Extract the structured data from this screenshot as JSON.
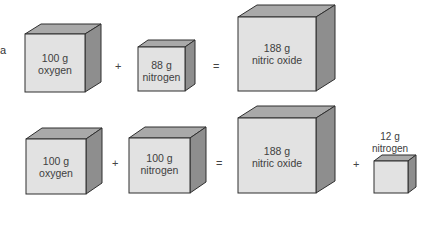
{
  "figure": {
    "part_label": "a",
    "colors": {
      "front_face": "#e2e2e2",
      "top_face": "#a9a9a9",
      "side_face": "#8e8e8e",
      "edge": "#2f2f2f"
    },
    "rows": [
      {
        "cubes": [
          {
            "mass": "100 g",
            "substance": "oxygen"
          },
          {
            "mass": "88 g",
            "substance": "nitrogen"
          },
          {
            "mass": "188 g",
            "substance": "nitric oxide"
          }
        ],
        "operators": [
          "+",
          "="
        ]
      },
      {
        "cubes": [
          {
            "mass": "100 g",
            "substance": "oxygen"
          },
          {
            "mass": "100 g",
            "substance": "nitrogen"
          },
          {
            "mass": "188 g",
            "substance": "nitric oxide"
          },
          {
            "mass": "12 g",
            "substance": "nitrogen"
          }
        ],
        "operators": [
          "+",
          "=",
          "+"
        ]
      }
    ]
  }
}
